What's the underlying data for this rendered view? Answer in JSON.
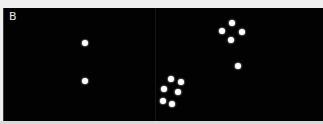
{
  "figure": {
    "panel_label": "B",
    "background_color": "#020202",
    "dot_color": "#ffffff",
    "subpanels": [
      {
        "name": "left",
        "dots": [
          {
            "x": 85,
            "y": 43
          },
          {
            "x": 85,
            "y": 81
          }
        ]
      },
      {
        "name": "right",
        "dots": [
          {
            "x": 232,
            "y": 23
          },
          {
            "x": 222,
            "y": 31
          },
          {
            "x": 242,
            "y": 32
          },
          {
            "x": 231,
            "y": 40
          },
          {
            "x": 238,
            "y": 66
          },
          {
            "x": 171,
            "y": 79
          },
          {
            "x": 181,
            "y": 82
          },
          {
            "x": 164,
            "y": 89
          },
          {
            "x": 178,
            "y": 92
          },
          {
            "x": 163,
            "y": 101
          },
          {
            "x": 172,
            "y": 104
          }
        ]
      }
    ]
  }
}
